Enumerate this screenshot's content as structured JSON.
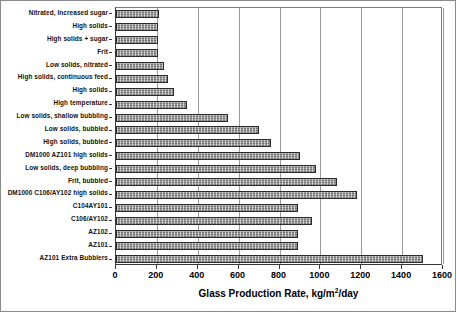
{
  "chart_data": {
    "type": "bar",
    "orientation": "horizontal",
    "title": "",
    "xlabel": "Glass Production Rate, kg/m2/day",
    "xlabel_parts": {
      "pre": "Glass Production Rate, kg/m",
      "sup": "2",
      "post": "/day"
    },
    "ylabel": "",
    "xlim": [
      0,
      1600
    ],
    "xticks": [
      0,
      200,
      400,
      600,
      800,
      1000,
      1200,
      1400,
      1600
    ],
    "xtick_labels": [
      "0",
      "200",
      "400",
      "600",
      "800",
      "1000",
      "1200",
      "1400",
      "1600"
    ],
    "grid": true,
    "grid_axis": "x",
    "legend": false,
    "bar_color": "#9e9e9e",
    "bar_edge_color": "#2b2b2b",
    "categories": [
      "Nitrated, Increased sugar",
      "High solids",
      "High solids + sugar",
      "Frit",
      "Low solids, nitrated",
      "High solids, continuous feed",
      "High solids",
      "High temperature",
      "Low solids, shallow bubbling",
      "Low solids, bubbled",
      "High solids, bubbled",
      "DM1000 AZ101 high solids",
      "Low solids, deep bubbling",
      "Frit, bubbled",
      "DM1000 C106/AY102 high solids",
      "C104AY101",
      "C106/AY102",
      "AZ102",
      "AZ101",
      "AZ101 Extra Bubblers"
    ],
    "values": [
      210,
      205,
      205,
      205,
      235,
      255,
      285,
      345,
      550,
      700,
      760,
      900,
      980,
      1080,
      1180,
      890,
      960,
      890,
      890,
      1500
    ]
  }
}
